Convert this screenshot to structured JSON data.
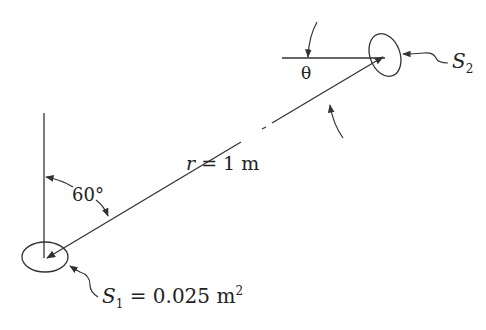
{
  "diagram": {
    "type": "radiation geometry between two surfaces",
    "labels": {
      "distance_var": "r",
      "distance_eq": " = 1 m",
      "angle_vertical": "60°",
      "angle_theta": "θ",
      "s1_var": "S",
      "s1_sub": "1",
      "s1_eq": " = 0.025 m",
      "s1_sup": "2",
      "s2_var": "S",
      "s2_sub": "2"
    },
    "colors": {
      "line": "#333333",
      "background": "#ffffff"
    }
  }
}
